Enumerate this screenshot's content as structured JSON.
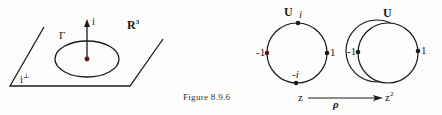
{
  "figure": {
    "caption": "Figure 8.9.6",
    "left_panel": {
      "space_label": "R",
      "space_exp": "3",
      "vector_label": "i",
      "curve_label": "Γ",
      "plane_label": "i",
      "plane_sup": "⊥"
    },
    "circle_u_i": {
      "title": "U",
      "top_label": "i",
      "bottom_label": "-i",
      "left_label": "-1",
      "right_label": "1"
    },
    "circle_u": {
      "title": "U",
      "left_label": "-1",
      "right_label": "1"
    },
    "map": {
      "from": "z",
      "to": "z",
      "to_exp": "2",
      "name": "ρ"
    },
    "colors": {
      "ink": "#1a1a1a",
      "point": "#2a1a1a",
      "red_point": "#5a1a1a",
      "background": "#fdfdfb"
    }
  }
}
